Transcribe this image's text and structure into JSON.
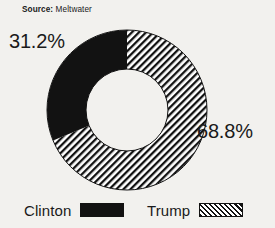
{
  "source": {
    "label": "Source:",
    "value": "Meltwater"
  },
  "labels": {
    "clinton_pct": "31.2%",
    "trump_pct": "68.8%"
  },
  "legend": {
    "items": [
      {
        "label": "Clinton",
        "swatch": "solid-black-swatch"
      },
      {
        "label": "Trump",
        "swatch": "diagonal-hatch-swatch"
      }
    ]
  },
  "colors": {
    "ink": "#121212",
    "background": "#f2f1ee",
    "hole": "#ffffff"
  },
  "chart_data": {
    "type": "pie",
    "variant": "donut",
    "title": "",
    "subtitle": "",
    "xlabel": "",
    "ylabel": "",
    "grid": false,
    "legend_position": "bottom",
    "hole_ratio": 0.51,
    "start_angle_deg": 0,
    "direction": "clockwise-from-top",
    "categories": [
      "Clinton",
      "Trump"
    ],
    "values": [
      31.2,
      68.8
    ],
    "value_labels": [
      "31.2%",
      "68.8%"
    ],
    "units": "percent",
    "slices": [
      {
        "name": "Clinton",
        "value": 31.2,
        "label": "31.2%",
        "fill": "solid",
        "color": "#121212",
        "sweep_deg": 112.32,
        "label_position": "outside-upper-left"
      },
      {
        "name": "Trump",
        "value": 68.8,
        "label": "68.8%",
        "fill": "diagonal-hatch",
        "color": "#121212",
        "sweep_deg": 247.68,
        "label_position": "outside-right"
      }
    ]
  },
  "geometry": {
    "center_x": 127,
    "center_y": 110,
    "outer_radius": 80,
    "inner_radius": 41
  }
}
